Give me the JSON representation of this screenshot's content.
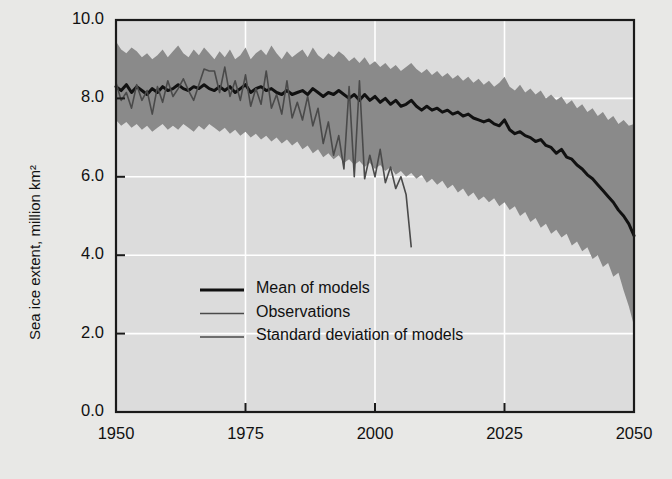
{
  "chart_data": {
    "type": "area",
    "title": "",
    "xlabel": "",
    "ylabel": "Sea ice extent, million km²",
    "xlim": [
      1950,
      2050
    ],
    "ylim": [
      0.0,
      10.0
    ],
    "grid": true,
    "legend_position": "center-left",
    "xticks": [
      "1950",
      "1975",
      "2000",
      "2025",
      "2050"
    ],
    "xtick_values": [
      1950,
      1975,
      2000,
      2025,
      2050
    ],
    "yticks": [
      "0.0",
      "2.0",
      "4.0",
      "6.0",
      "8.0",
      "10.0"
    ],
    "ytick_values": [
      0.0,
      2.0,
      4.0,
      6.0,
      8.0,
      10.0
    ],
    "colors": {
      "band": "#8a8a8a",
      "plot_background": "#dcdcdc",
      "figure_background": "#e8e8e6",
      "mean_line": "#111111",
      "observations_line": "#4a4a4a",
      "grid": "#ffffff",
      "axis": "#1a1a1a",
      "text": "#111111"
    },
    "legend": [
      {
        "label": "Mean of models",
        "color": "#111111",
        "width": 3.0
      },
      {
        "label": "Observations",
        "color": "#4a4a4a",
        "width": 1.6
      },
      {
        "label": "Standard deviation of models",
        "color": "#6e6e6e",
        "width": 1.8
      }
    ],
    "series": [
      {
        "name": "Standard deviation of models",
        "type": "band",
        "x": [
          1950,
          1951,
          1952,
          1953,
          1954,
          1955,
          1956,
          1957,
          1958,
          1959,
          1960,
          1961,
          1962,
          1963,
          1964,
          1965,
          1966,
          1967,
          1968,
          1969,
          1970,
          1971,
          1972,
          1973,
          1974,
          1975,
          1976,
          1977,
          1978,
          1979,
          1980,
          1981,
          1982,
          1983,
          1984,
          1985,
          1986,
          1987,
          1988,
          1989,
          1990,
          1991,
          1992,
          1993,
          1994,
          1995,
          1996,
          1997,
          1998,
          1999,
          2000,
          2001,
          2002,
          2003,
          2004,
          2005,
          2006,
          2007,
          2008,
          2009,
          2010,
          2011,
          2012,
          2013,
          2014,
          2015,
          2016,
          2017,
          2018,
          2019,
          2020,
          2021,
          2022,
          2023,
          2024,
          2025,
          2026,
          2027,
          2028,
          2029,
          2030,
          2031,
          2032,
          2033,
          2034,
          2035,
          2036,
          2037,
          2038,
          2039,
          2040,
          2041,
          2042,
          2043,
          2044,
          2045,
          2046,
          2047,
          2048,
          2049,
          2050
        ],
        "upper": [
          9.45,
          9.25,
          9.15,
          9.3,
          9.2,
          9.05,
          9.15,
          9.0,
          9.1,
          9.25,
          9.05,
          9.2,
          9.35,
          9.15,
          9.05,
          9.25,
          9.1,
          9.3,
          9.15,
          9.0,
          9.2,
          9.05,
          9.25,
          9.0,
          9.1,
          9.3,
          9.0,
          9.15,
          9.25,
          9.1,
          9.35,
          9.15,
          9.0,
          9.2,
          9.05,
          9.15,
          9.25,
          9.05,
          9.3,
          9.1,
          9.0,
          9.15,
          9.05,
          9.2,
          9.1,
          8.95,
          9.05,
          8.9,
          9.05,
          8.85,
          8.95,
          8.8,
          8.9,
          8.75,
          8.85,
          8.7,
          8.8,
          8.9,
          8.75,
          8.65,
          8.75,
          8.6,
          8.7,
          8.55,
          8.65,
          8.5,
          8.6,
          8.45,
          8.55,
          8.4,
          8.5,
          8.35,
          8.45,
          8.3,
          8.4,
          8.55,
          8.3,
          8.2,
          8.35,
          8.15,
          8.25,
          8.1,
          8.2,
          8.0,
          8.1,
          7.95,
          8.05,
          7.85,
          7.95,
          7.75,
          7.85,
          7.65,
          7.75,
          7.55,
          7.65,
          7.45,
          7.55,
          7.35,
          7.45,
          7.3,
          7.35
        ],
        "lower": [
          7.45,
          7.3,
          7.4,
          7.25,
          7.35,
          7.2,
          7.3,
          7.15,
          7.25,
          7.35,
          7.2,
          7.3,
          7.2,
          7.35,
          7.25,
          7.15,
          7.3,
          7.2,
          7.35,
          7.25,
          7.15,
          7.25,
          7.1,
          7.2,
          7.05,
          7.15,
          7.0,
          7.1,
          6.95,
          7.05,
          6.9,
          7.0,
          6.85,
          6.95,
          6.8,
          6.9,
          6.7,
          6.8,
          6.6,
          6.7,
          6.5,
          6.6,
          6.45,
          6.55,
          6.35,
          6.45,
          6.3,
          6.4,
          6.25,
          6.35,
          6.2,
          6.3,
          6.15,
          6.25,
          6.05,
          6.15,
          6.0,
          6.1,
          5.95,
          6.05,
          5.85,
          5.95,
          5.8,
          5.9,
          5.7,
          5.8,
          5.6,
          5.7,
          5.5,
          5.6,
          5.4,
          5.5,
          5.35,
          5.45,
          5.25,
          5.35,
          5.15,
          5.25,
          5.0,
          5.1,
          4.85,
          4.95,
          4.7,
          4.8,
          4.55,
          4.65,
          4.45,
          4.55,
          4.25,
          4.35,
          4.1,
          4.2,
          3.9,
          4.0,
          3.7,
          3.8,
          3.45,
          3.55,
          3.1,
          2.7,
          2.2
        ]
      },
      {
        "name": "Mean of models",
        "type": "line",
        "x": [
          1950,
          1951,
          1952,
          1953,
          1954,
          1955,
          1956,
          1957,
          1958,
          1959,
          1960,
          1961,
          1962,
          1963,
          1964,
          1965,
          1966,
          1967,
          1968,
          1969,
          1970,
          1971,
          1972,
          1973,
          1974,
          1975,
          1976,
          1977,
          1978,
          1979,
          1980,
          1981,
          1982,
          1983,
          1984,
          1985,
          1986,
          1987,
          1988,
          1989,
          1990,
          1991,
          1992,
          1993,
          1994,
          1995,
          1996,
          1997,
          1998,
          1999,
          2000,
          2001,
          2002,
          2003,
          2004,
          2005,
          2006,
          2007,
          2008,
          2009,
          2010,
          2011,
          2012,
          2013,
          2014,
          2015,
          2016,
          2017,
          2018,
          2019,
          2020,
          2021,
          2022,
          2023,
          2024,
          2025,
          2026,
          2027,
          2028,
          2029,
          2030,
          2031,
          2032,
          2033,
          2034,
          2035,
          2036,
          2037,
          2038,
          2039,
          2040,
          2041,
          2042,
          2043,
          2044,
          2045,
          2046,
          2047,
          2048,
          2049,
          2050
        ],
        "y": [
          8.3,
          8.2,
          8.35,
          8.15,
          8.3,
          8.2,
          8.1,
          8.25,
          8.15,
          8.3,
          8.2,
          8.25,
          8.35,
          8.25,
          8.2,
          8.3,
          8.25,
          8.35,
          8.25,
          8.2,
          8.3,
          8.2,
          8.3,
          8.15,
          8.25,
          8.35,
          8.15,
          8.25,
          8.3,
          8.2,
          8.25,
          8.15,
          8.1,
          8.2,
          8.1,
          8.15,
          8.2,
          8.1,
          8.25,
          8.15,
          8.05,
          8.15,
          8.1,
          8.2,
          8.1,
          8.0,
          8.1,
          7.95,
          8.1,
          7.95,
          8.05,
          7.9,
          8.0,
          7.85,
          7.95,
          7.8,
          7.85,
          7.95,
          7.8,
          7.7,
          7.8,
          7.7,
          7.75,
          7.65,
          7.7,
          7.6,
          7.65,
          7.55,
          7.6,
          7.5,
          7.45,
          7.4,
          7.45,
          7.35,
          7.3,
          7.45,
          7.2,
          7.1,
          7.15,
          7.05,
          7.0,
          6.9,
          6.95,
          6.8,
          6.75,
          6.6,
          6.7,
          6.5,
          6.45,
          6.3,
          6.2,
          6.05,
          5.95,
          5.8,
          5.65,
          5.5,
          5.35,
          5.15,
          5.0,
          4.8,
          4.5
        ]
      },
      {
        "name": "Observations",
        "type": "line",
        "x": [
          1950,
          1951,
          1952,
          1953,
          1954,
          1955,
          1956,
          1957,
          1958,
          1959,
          1960,
          1961,
          1962,
          1963,
          1964,
          1965,
          1966,
          1967,
          1968,
          1969,
          1970,
          1971,
          1972,
          1973,
          1974,
          1975,
          1976,
          1977,
          1978,
          1979,
          1980,
          1981,
          1982,
          1983,
          1984,
          1985,
          1986,
          1987,
          1988,
          1989,
          1990,
          1991,
          1992,
          1993,
          1994,
          1995,
          1996,
          1997,
          1998,
          1999,
          2000,
          2001,
          2002,
          2003,
          2004,
          2005,
          2006,
          2007
        ],
        "y": [
          8.4,
          7.95,
          8.15,
          7.75,
          8.35,
          7.95,
          8.2,
          7.6,
          8.3,
          7.9,
          8.45,
          8.05,
          8.25,
          8.5,
          8.2,
          7.95,
          8.35,
          8.75,
          8.7,
          8.7,
          8.15,
          8.8,
          8.05,
          8.45,
          7.95,
          8.6,
          7.8,
          8.25,
          7.85,
          8.7,
          7.75,
          8.1,
          7.6,
          8.45,
          7.5,
          7.9,
          7.45,
          8.05,
          7.3,
          7.75,
          6.85,
          7.4,
          6.55,
          7.05,
          6.2,
          8.3,
          6.0,
          8.45,
          5.95,
          6.55,
          6.0,
          6.7,
          5.85,
          6.25,
          5.7,
          6.0,
          5.55,
          4.2
        ]
      }
    ]
  }
}
